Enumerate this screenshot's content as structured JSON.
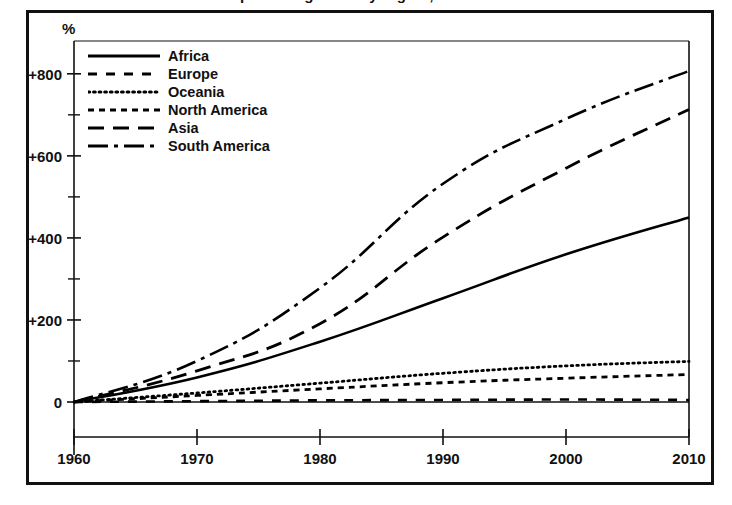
{
  "figure": {
    "clipped_title": "Population growth by region, 1960-2010",
    "y_axis_unit": "%"
  },
  "chart_data": {
    "type": "line",
    "title": "",
    "xlabel": "",
    "ylabel": "%",
    "x": [
      1960,
      1970,
      1980,
      1990,
      2000,
      2010
    ],
    "x_tick_labels": [
      "1960",
      "1970",
      "1980",
      "1990",
      "2000",
      "2010"
    ],
    "y_tick_labels": [
      "0",
      "+200",
      "+400",
      "+600",
      "+800"
    ],
    "y_major_ticks": [
      0,
      200,
      400,
      600,
      800
    ],
    "y_minor_ticks": [
      100,
      300,
      500,
      700
    ],
    "xlim": [
      1960,
      2010
    ],
    "ylim": [
      -20,
      880
    ],
    "grid": false,
    "legend_position": "top-left inside axes",
    "series": [
      {
        "name": "Africa",
        "dash": "solid",
        "color": "#000000",
        "values": [
          0,
          60,
          147,
          253,
          360,
          450
        ]
      },
      {
        "name": "Europe",
        "dash": "dashed-medium",
        "color": "#000000",
        "values": [
          0,
          2,
          4,
          5,
          6,
          5
        ]
      },
      {
        "name": "Oceania",
        "dash": "dotted",
        "color": "#000000",
        "values": [
          0,
          22,
          46,
          70,
          88,
          99
        ]
      },
      {
        "name": "North America",
        "dash": "dashed-short",
        "color": "#000000",
        "values": [
          0,
          16,
          32,
          47,
          58,
          67
        ]
      },
      {
        "name": "Asia",
        "dash": "dashed-long",
        "color": "#000000",
        "values": [
          0,
          76,
          191,
          402,
          570,
          713
        ]
      },
      {
        "name": "South America",
        "dash": "dash-dot",
        "color": "#000000",
        "values": [
          0,
          100,
          278,
          532,
          690,
          807
        ]
      }
    ]
  },
  "legend": {
    "items": [
      {
        "label": "Africa",
        "swatch": "solid-line-swatch"
      },
      {
        "label": "Europe",
        "swatch": "dashed-medium-line-swatch"
      },
      {
        "label": "Oceania",
        "swatch": "dotted-line-swatch"
      },
      {
        "label": "North America",
        "swatch": "dashed-short-line-swatch"
      },
      {
        "label": "Asia",
        "swatch": "dashed-long-line-swatch"
      },
      {
        "label": "South America",
        "swatch": "dash-dot-line-swatch"
      }
    ]
  }
}
